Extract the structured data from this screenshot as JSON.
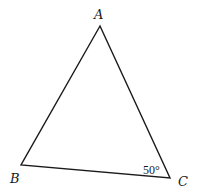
{
  "diagram": {
    "type": "triangle",
    "vertices": [
      {
        "label": "A",
        "x": 100,
        "y": 26
      },
      {
        "label": "B",
        "x": 21,
        "y": 165
      },
      {
        "label": "C",
        "x": 170,
        "y": 178
      }
    ],
    "angle_marks": [
      {
        "vertex": "C",
        "text": "50°"
      }
    ],
    "stroke_color": "#1a1a1a"
  }
}
